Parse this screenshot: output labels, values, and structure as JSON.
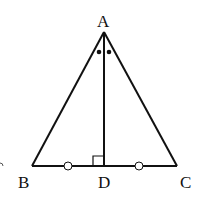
{
  "diagram": {
    "type": "geometry",
    "points": {
      "A": {
        "label": "A",
        "x": 104,
        "y": 32
      },
      "B": {
        "label": "B",
        "x": 32,
        "y": 166
      },
      "C": {
        "label": "C",
        "x": 177,
        "y": 166
      },
      "D": {
        "label": "D",
        "x": 104,
        "y": 166
      }
    },
    "segments": [
      "AB",
      "AC",
      "BC",
      "AD"
    ],
    "marks": {
      "right_angle_at": "D",
      "equal_angles_at_A": "BAD = DAC (dots)",
      "equal_segments": "BD = DC (circles)"
    },
    "colors": {
      "stroke": "#111111",
      "background": "#ffffff"
    }
  }
}
